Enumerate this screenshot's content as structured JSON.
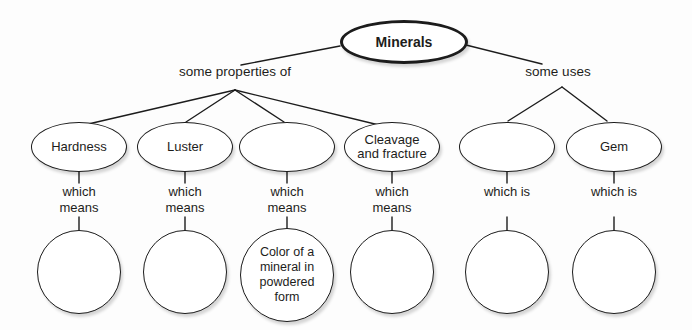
{
  "diagram": {
    "root": "Minerals",
    "branches": {
      "left": "some properties of",
      "right": "some uses"
    },
    "columns": [
      {
        "oval": "Hardness",
        "link": "which means",
        "leaf": ""
      },
      {
        "oval": "Luster",
        "link": "which means",
        "leaf": ""
      },
      {
        "oval": "",
        "link": "which means",
        "leaf": "Color of a mineral in powdered form"
      },
      {
        "oval": "Cleavage and fracture",
        "link": "which means",
        "leaf": ""
      },
      {
        "oval": "",
        "link": "which is",
        "leaf": ""
      },
      {
        "oval": "Gem",
        "link": "which is",
        "leaf": ""
      }
    ]
  }
}
